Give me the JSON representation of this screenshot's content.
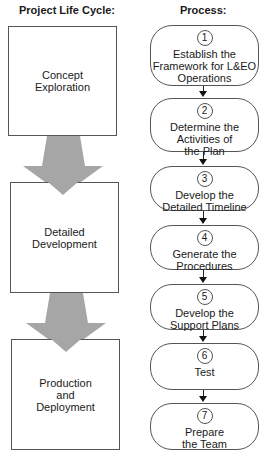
{
  "headers": {
    "lifecycle": "Project Life Cycle:",
    "process": "Process:"
  },
  "lifecycle_stages": [
    {
      "label": "Concept\nExploration"
    },
    {
      "label": "Detailed\nDevelopment"
    },
    {
      "label": "Production\nand\nDeployment"
    }
  ],
  "process_steps": [
    {
      "number": "1",
      "label": "Establish the\nFramework for L&EO\nOperations"
    },
    {
      "number": "2",
      "label": "Determine the\nActivities of\nthe Plan"
    },
    {
      "number": "3",
      "label": "Develop the\nDetailed Timeline"
    },
    {
      "number": "4",
      "label": "Generate the\nProcedures"
    },
    {
      "number": "5",
      "label": "Develop the\nSupport Plans"
    },
    {
      "number": "6",
      "label": "Test"
    },
    {
      "number": "7",
      "label": "Prepare\nthe Team"
    }
  ],
  "colors": {
    "stage_arrow": "#a6a6a6",
    "border": "#555555",
    "connector": "#111111"
  }
}
